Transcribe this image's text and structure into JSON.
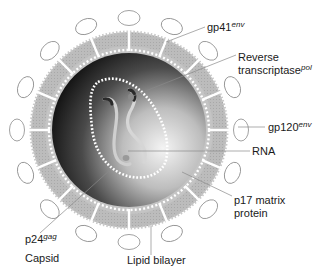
{
  "diagram": {
    "colors": {
      "background": "#ffffff",
      "lipid_layer": "#b8b8b8",
      "lipid_inner_dots": "#ffffff",
      "matrix_light": "#f2f2f2",
      "matrix_dark": "#1e1e1e",
      "capsid_dots": "#ffffff",
      "rna": "#d8d8d8",
      "spike": "#ffffff",
      "spike_outline": "#888888",
      "leader_line": "#8a8a8a",
      "text": "#1a1a1a"
    },
    "labels": {
      "gp41": {
        "text": "gp41",
        "superscript": "env"
      },
      "reverse_transcriptase": {
        "line1": "Reverse",
        "line2": "transcriptase",
        "superscript": "pol"
      },
      "gp120": {
        "text": "gp120",
        "superscript": "env"
      },
      "rna": {
        "text": "RNA"
      },
      "p17": {
        "line1": "p17 matrix",
        "line2": "protein"
      },
      "p24": {
        "text": "p24",
        "superscript": "gag",
        "line2": "Capsid"
      },
      "lipid_bilayer": {
        "text": "Lipid bilayer"
      }
    },
    "spike_count": 16
  }
}
